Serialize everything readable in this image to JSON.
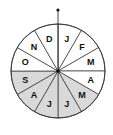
{
  "diagram": {
    "type": "month-wheel",
    "center": [
      58,
      71
    ],
    "radius": 47,
    "shade_color": "#d9d9d9",
    "stroke_color": "#333333",
    "sectors": [
      {
        "label": "J",
        "shaded": false
      },
      {
        "label": "F",
        "shaded": false
      },
      {
        "label": "M",
        "shaded": false
      },
      {
        "label": "A",
        "shaded": false
      },
      {
        "label": "M",
        "shaded": true
      },
      {
        "label": "J",
        "shaded": true
      },
      {
        "label": "J",
        "shaded": true
      },
      {
        "label": "A",
        "shaded": true
      },
      {
        "label": "S",
        "shaded": true
      },
      {
        "label": "O",
        "shaded": false
      },
      {
        "label": "N",
        "shaded": false
      },
      {
        "label": "D",
        "shaded": false
      }
    ]
  }
}
